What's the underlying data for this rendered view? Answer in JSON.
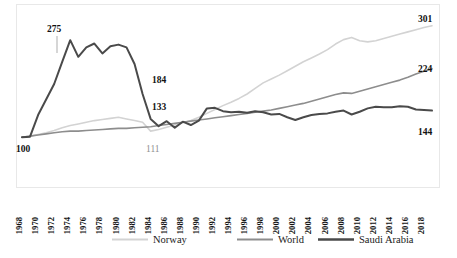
{
  "chart_data": {
    "type": "line",
    "title": "",
    "subtitle": "",
    "xlabel": "",
    "ylabel": "",
    "grid": false,
    "legend_position": "bottom",
    "index_base": 100,
    "x": [
      1968,
      1969,
      1970,
      1971,
      1972,
      1973,
      1974,
      1975,
      1976,
      1977,
      1978,
      1979,
      1980,
      1981,
      1982,
      1983,
      1984,
      1985,
      1986,
      1987,
      1988,
      1989,
      1990,
      1991,
      1992,
      1993,
      1994,
      1995,
      1996,
      1997,
      1998,
      1999,
      2000,
      2001,
      2002,
      2003,
      2004,
      2005,
      2006,
      2007,
      2008,
      2009,
      2010,
      2011,
      2012,
      2013,
      2014,
      2015,
      2016,
      2017,
      2018,
      2019
    ],
    "xtick_labels": [
      "1968",
      "1970",
      "1972",
      "1974",
      "1976",
      "1978",
      "1980",
      "1982",
      "1984",
      "1986",
      "1988",
      "1990",
      "1992",
      "1994",
      "1996",
      "1998",
      "2000",
      "2002",
      "2004",
      "2006",
      "2008",
      "2010",
      "2012",
      "2014",
      "2016",
      "2018"
    ],
    "ylim": [
      95,
      315
    ],
    "xlim": [
      1968,
      2019
    ],
    "series": [
      {
        "name": "Norway",
        "color": "#d3d3d3",
        "width": 1.6,
        "values": [
          100,
          102,
          105,
          108,
          112,
          117,
          121,
          124,
          127,
          130,
          132,
          134,
          136,
          133,
          130,
          127,
          111,
          114,
          118,
          122,
          126,
          130,
          136,
          143,
          150,
          157,
          163,
          170,
          178,
          188,
          198,
          205,
          212,
          220,
          228,
          236,
          243,
          250,
          258,
          268,
          276,
          280,
          274,
          272,
          274,
          278,
          282,
          286,
          290,
          294,
          298,
          301
        ]
      },
      {
        "name": "World",
        "color": "#8d8d8d",
        "width": 1.6,
        "values": [
          100,
          102,
          104,
          106,
          108,
          110,
          111,
          111,
          112,
          113,
          114,
          115,
          116,
          116,
          117,
          118,
          119,
          121,
          123,
          125,
          127,
          129,
          131,
          133,
          135,
          137,
          139,
          141,
          143,
          145,
          147,
          149,
          152,
          155,
          158,
          161,
          165,
          169,
          173,
          177,
          180,
          179,
          183,
          187,
          191,
          195,
          199,
          203,
          208,
          214,
          219,
          224
        ]
      },
      {
        "name": "Saudi Arabia",
        "color": "#4a4a4a",
        "width": 2.0,
        "values": [
          100,
          101,
          140,
          168,
          196,
          236,
          275,
          245,
          262,
          269,
          251,
          264,
          267,
          262,
          232,
          178,
          133,
          120,
          129,
          117,
          128,
          122,
          130,
          152,
          153,
          147,
          145,
          146,
          144,
          147,
          145,
          141,
          142,
          136,
          131,
          136,
          140,
          142,
          143,
          146,
          148,
          141,
          146,
          152,
          155,
          154,
          154,
          156,
          155,
          150,
          149,
          148
        ]
      }
    ],
    "annotations": [
      {
        "text": "275",
        "value": 275,
        "year": 1974,
        "style": "bold",
        "placement": "above"
      },
      {
        "text": "100",
        "value": 100,
        "year": 1968,
        "style": "bold",
        "placement": "below-left"
      },
      {
        "text": "184",
        "value": 184,
        "year": 1984,
        "style": "bold",
        "placement": "right"
      },
      {
        "text": "133",
        "value": 133,
        "year": 1984,
        "style": "bold",
        "placement": "right"
      },
      {
        "text": "111",
        "value": 111,
        "year": 1984,
        "style": "light",
        "placement": "below"
      },
      {
        "text": "301",
        "value": 301,
        "year": 2019,
        "style": "bold",
        "placement": "end"
      },
      {
        "text": "224",
        "value": 224,
        "year": 2019,
        "style": "bold",
        "placement": "end"
      },
      {
        "text": "144",
        "value": 144,
        "year": 2019,
        "style": "bold",
        "placement": "end"
      }
    ],
    "legend": [
      {
        "label": "Norway",
        "color": "#d3d3d3",
        "width": 1.8
      },
      {
        "label": "World",
        "color": "#8d8d8d",
        "width": 1.8
      },
      {
        "label": "Saudi Arabia",
        "color": "#4a4a4a",
        "width": 2.6
      }
    ]
  }
}
